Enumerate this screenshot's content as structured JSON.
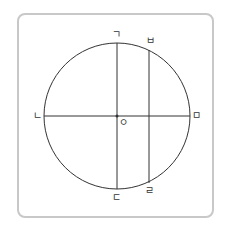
{
  "diagram": {
    "type": "circle-with-chords",
    "circle": {
      "cx": 117,
      "cy": 116,
      "r": 73,
      "stroke": "#333333"
    },
    "center_label": "ㅇ",
    "points": {
      "top": "ㄱ",
      "left": "ㄴ",
      "bottom": "ㄷ",
      "bottom_right": "ㄹ",
      "right": "ㅁ",
      "top_right": "ㅂ"
    },
    "segments": [
      {
        "from": "ㄱ",
        "to": "ㄷ",
        "kind": "diameter",
        "orientation": "vertical"
      },
      {
        "from": "ㄴ",
        "to": "ㅁ",
        "kind": "diameter",
        "orientation": "horizontal"
      },
      {
        "from": "ㅂ",
        "to": "ㄹ",
        "kind": "chord",
        "orientation": "vertical"
      }
    ],
    "frame_color": "#c8c8c8"
  }
}
